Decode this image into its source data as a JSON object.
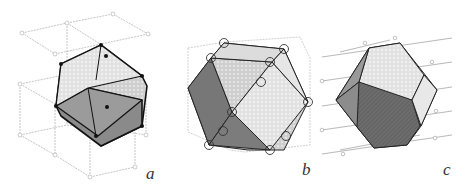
{
  "figure": {
    "panels": [
      {
        "id": "a",
        "label": "a",
        "shape": "truncated-cube-like polyhedron in cubic lattice"
      },
      {
        "id": "b",
        "label": "b",
        "shape": "cuboctahedron with circled lattice points"
      },
      {
        "id": "c",
        "label": "c",
        "shape": "truncated octahedron in layered lattice"
      }
    ]
  }
}
